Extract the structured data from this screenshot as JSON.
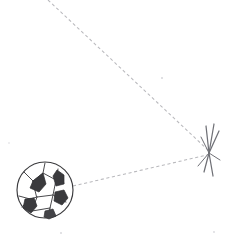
{
  "scene": {
    "title": "Soccer ball trajectory diagram",
    "background_color": "#ffffff",
    "width": 225,
    "height": 242,
    "caption": ""
  },
  "ball": {
    "label": "soccer ball",
    "center_x": 45,
    "center_y": 190,
    "radius": 28,
    "outline_color": "#3b3b3e",
    "panel_color": "#3a3a3d",
    "body_color": "#ffffff"
  },
  "impact": {
    "label": "impact burst",
    "x": 210,
    "y": 153,
    "stroke_color": "#6f7076",
    "ray_count": 6
  },
  "trajectories": [
    {
      "name": "incoming-path",
      "from_x": 48,
      "from_y": 0,
      "to_x": 209,
      "to_y": 151,
      "style": "dashed",
      "color": "#b9b9bd"
    },
    {
      "name": "outgoing-path",
      "from_x": 73,
      "from_y": 186,
      "to_x": 207,
      "to_y": 155,
      "style": "dashed",
      "color": "#b9b9bd"
    }
  ]
}
